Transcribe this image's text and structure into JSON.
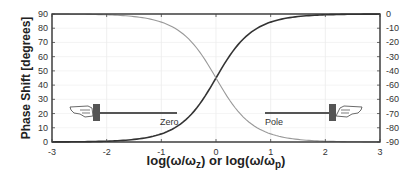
{
  "chart_data": {
    "type": "line",
    "title": "",
    "xlabel": "log(ω/ωz) or log(ω/ωp)",
    "xlabel_parts": {
      "a": "log(ω/ω",
      "a_sub": "z",
      "mid": ") or log(ω/ω",
      "b_sub": "p",
      "end": ")"
    },
    "ylabel": "Phase Shift [degrees]",
    "xlim": [
      -3,
      3
    ],
    "ylim": [
      0,
      90
    ],
    "y2lim": [
      -90,
      0
    ],
    "x_ticks": [
      "-3",
      "-2",
      "-1",
      "0",
      "1",
      "2",
      "3"
    ],
    "y_ticks": [
      "0",
      "10",
      "20",
      "30",
      "40",
      "50",
      "60",
      "70",
      "80",
      "90"
    ],
    "y2_ticks": [
      "0",
      "-10",
      "-20",
      "-30",
      "-40",
      "-60",
      "-60",
      "-70",
      "-80",
      "-90"
    ],
    "grid": true,
    "x": [
      -3,
      -2.5,
      -2,
      -1.5,
      -1,
      -0.5,
      0,
      0.5,
      1,
      1.5,
      2,
      2.5,
      3
    ],
    "series": [
      {
        "name": "Zero",
        "axis": "left",
        "color": "#333333",
        "values": [
          0.06,
          0.18,
          0.57,
          1.81,
          5.71,
          17.55,
          45,
          72.45,
          84.29,
          88.19,
          89.43,
          89.82,
          89.94
        ]
      },
      {
        "name": "Pole",
        "axis": "right",
        "color": "#999999",
        "values": [
          -0.06,
          -0.18,
          -0.57,
          -1.81,
          -5.71,
          -17.55,
          -45,
          -72.45,
          -84.29,
          -88.19,
          -89.43,
          -89.82,
          -89.94
        ]
      }
    ],
    "annotations": [
      {
        "text": "Zero",
        "points_to": "left axis",
        "icon": "pointing-hand-left-icon"
      },
      {
        "text": "Pole",
        "points_to": "right axis",
        "icon": "pointing-hand-right-icon"
      }
    ],
    "legend": "none"
  }
}
